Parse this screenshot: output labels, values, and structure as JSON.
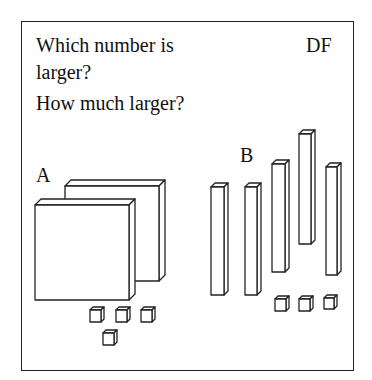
{
  "question": {
    "line1": "Which number is",
    "line2": "larger?",
    "line3": "How much larger?"
  },
  "tag": "DF",
  "labels": {
    "a": "A",
    "b": "B"
  },
  "groups": {
    "A": {
      "flats": 2,
      "rods": 0,
      "units": 4,
      "value": 204
    },
    "B": {
      "flats": 0,
      "rods": 5,
      "units": 3,
      "value": 53
    }
  },
  "colors": {
    "line": "#222222",
    "fill": "#ffffff"
  }
}
